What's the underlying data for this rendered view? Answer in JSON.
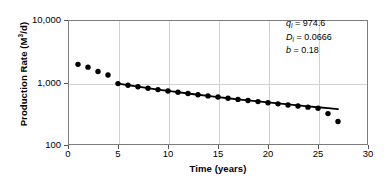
{
  "chart_data": {
    "type": "scatter",
    "title": "",
    "xlabel": "Time (years)",
    "ylabel": "Production Rate (M3/d)",
    "ylabel_base": "Production Rate (M",
    "ylabel_sup": "3",
    "ylabel_tail": "/d)",
    "xlim": [
      0,
      30
    ],
    "ylim": [
      100,
      10000
    ],
    "yscale": "log",
    "xscale": "linear",
    "grid": true,
    "legend": "none",
    "xticks": [
      0,
      5,
      10,
      15,
      20,
      25,
      30
    ],
    "xticklabels": [
      "0",
      "5",
      "10",
      "15",
      "20",
      "25",
      "30"
    ],
    "yticks": [
      100,
      1000,
      10000
    ],
    "yticklabels": [
      "100",
      "1,000",
      "10,000"
    ],
    "series": [
      {
        "name": "Observed production rate",
        "marker": "filled-circle",
        "color": "#000000",
        "x": [
          1,
          2,
          3,
          4,
          5,
          6,
          7,
          8,
          9,
          10,
          11,
          12,
          13,
          14,
          15,
          16,
          17,
          18,
          19,
          20,
          21,
          22,
          23,
          24,
          25,
          26,
          27
        ],
        "y": [
          1950,
          1760,
          1500,
          1320,
          960,
          905,
          855,
          810,
          770,
          730,
          700,
          668,
          638,
          610,
          585,
          560,
          537,
          515,
          495,
          475,
          455,
          437,
          420,
          403,
          387,
          318,
          238
        ]
      },
      {
        "name": "Hyperbolic decline fit",
        "marker": "line",
        "color": "#000000",
        "x": [
          5,
          6,
          7,
          8,
          9,
          10,
          11,
          12,
          13,
          14,
          15,
          16,
          17,
          18,
          19,
          20,
          21,
          22,
          23,
          24,
          25,
          26,
          27
        ],
        "y": [
          962,
          908,
          858,
          813,
          772,
          734,
          699,
          667,
          637,
          610,
          584,
          560,
          538,
          517,
          498,
          479,
          462,
          446,
          430,
          415,
          402,
          389,
          376
        ]
      }
    ],
    "annotations": [
      {
        "symbol": "q",
        "subscript": "i",
        "equals": "=",
        "value": "974.6"
      },
      {
        "symbol": "D",
        "subscript": "i",
        "equals": "=",
        "value": "0.0666"
      },
      {
        "symbol": "b",
        "subscript": "",
        "equals": "=",
        "value": "0.18"
      }
    ],
    "colors": {
      "marker": "#000000",
      "fitline": "#1a1a1a",
      "grid": "#d2d2d2",
      "frame": "#7d7d7d",
      "background": "#ffffff"
    }
  }
}
